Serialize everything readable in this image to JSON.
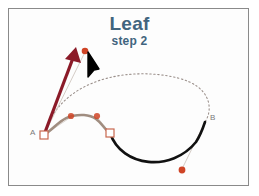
{
  "document": {
    "title": "Leaf",
    "step": "step 2"
  },
  "frame": {
    "border_color": "#8a8a8a",
    "background_color": "#fdfdfd"
  },
  "theme": {
    "title_color": "#41647e",
    "arrow_color": "#8b1a28",
    "control_point_color": "#cf4426",
    "anchor_stroke_color": "#c9684f",
    "path_preview_color": "#9a8f8a",
    "path_solid_color": "#111111",
    "path_highlight_color": "#a08d80",
    "handle_line_color": "#cfc6c0",
    "cursor_color": "#000000",
    "label_color": "#7a7a7a"
  },
  "canvas": {
    "anchors": [
      {
        "name": "A",
        "label": "A",
        "x": 44,
        "y": 135,
        "selected": true
      },
      {
        "name": "B",
        "label": "B",
        "x": 205,
        "y": 122,
        "selected": false
      },
      {
        "name": "mid",
        "label": "",
        "x": 110,
        "y": 133,
        "selected": true
      }
    ],
    "control_points": [
      {
        "name": "handle-top",
        "x": 85,
        "y": 51
      },
      {
        "name": "handle-curve-left",
        "x": 71,
        "y": 116
      },
      {
        "name": "handle-curve-right",
        "x": 97,
        "y": 116
      },
      {
        "name": "handle-bottom",
        "x": 182,
        "y": 170
      }
    ],
    "drag_arrow": {
      "name": "drag-arrow",
      "from_x": 44,
      "from_y": 135,
      "to_x": 76,
      "to_y": 50
    },
    "cursor": {
      "name": "mouse-cursor",
      "x": 88,
      "y": 52
    },
    "paths": {
      "preview_dotted": "M 44 135 C 60 78, 130 66, 178 78 C 210 86, 214 108, 205 122",
      "solid_black": "M 110 133 C 122 168, 172 172, 196 142 C 200 136, 203 128, 205 122",
      "highlight_curve": "M 44 135 C 58 126, 62 114, 84 115 C 100 116, 102 128, 110 133"
    }
  }
}
